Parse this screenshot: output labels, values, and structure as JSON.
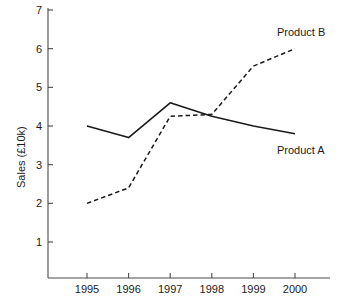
{
  "chart_data": {
    "type": "line",
    "title": "",
    "xlabel": "",
    "ylabel": "Sales  (£10k)",
    "categories": [
      "1995",
      "1996",
      "1997",
      "1998",
      "1999",
      "2000"
    ],
    "x": [
      1995,
      1996,
      1997,
      1998,
      1999,
      2000
    ],
    "xlim": [
      1995,
      2000
    ],
    "ylim": [
      0,
      7
    ],
    "yticks": [
      1,
      2,
      3,
      4,
      5,
      6,
      7
    ],
    "ytick_labels": [
      "1",
      "2",
      "3",
      "4",
      "5",
      "6",
      "7"
    ],
    "xticks": [
      1995,
      1996,
      1997,
      1998,
      1999,
      2000
    ],
    "xtick_labels": [
      "1995",
      "1996",
      "1997",
      "1998",
      "1999",
      "2000"
    ],
    "grid": false,
    "legend_position": "inline-right-end-of-line",
    "series": [
      {
        "name": "Product A",
        "style": "solid",
        "color": "#1a1a1a",
        "values": [
          4.0,
          3.7,
          4.6,
          4.25,
          4.0,
          3.8
        ],
        "label_text": "Product A"
      },
      {
        "name": "Product B",
        "style": "dashed",
        "color": "#1a1a1a",
        "values": [
          2.0,
          2.4,
          4.25,
          4.3,
          5.55,
          6.0
        ],
        "label_text": "Product B"
      }
    ],
    "annotations": [
      {
        "text": "Product B",
        "target_series": "Product B",
        "at_x": 2000
      },
      {
        "text": "Product A",
        "target_series": "Product A",
        "at_x": 2000
      }
    ]
  },
  "axes": {
    "y_axis_name": "sales-axis",
    "x_axis_name": "year-axis"
  }
}
